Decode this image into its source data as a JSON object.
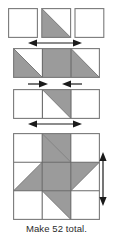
{
  "diagram": {
    "kind": "quilt-block-assembly-diagram",
    "caption": "Make 52 total.",
    "colors": {
      "fabric_shaded": "#9b9b9b",
      "fabric_background": "#ffffff",
      "outline": "#7a7a7a",
      "seam_line": "#6a6a6a",
      "arrow": "#1a1a1a",
      "caption_text": "#2b2b2b"
    },
    "rows": [
      {
        "id": "row-1",
        "name": "three-patch-top-row",
        "cells": [
          {
            "name": "plain-square-left",
            "fill": "background"
          },
          {
            "name": "half-square-triangle-gray-lower-left",
            "fill": "triangle-lower-left"
          },
          {
            "name": "plain-square-right",
            "fill": "background"
          }
        ]
      },
      {
        "id": "row-2",
        "name": "middle-row-strip",
        "cells": [
          {
            "name": "half-square-triangle-gray-lower-left",
            "fill": "triangle-lower-left"
          },
          {
            "name": "solid-gray-square",
            "fill": "shaded"
          },
          {
            "name": "half-square-triangle-gray-lower-left",
            "fill": "triangle-lower-left"
          }
        ]
      },
      {
        "id": "row-3",
        "name": "three-patch-bottom-row",
        "cells": [
          {
            "name": "plain-square-left",
            "fill": "background"
          },
          {
            "name": "half-square-triangle-gray-upper-right",
            "fill": "triangle-upper-right"
          },
          {
            "name": "plain-square-right",
            "fill": "background"
          }
        ]
      }
    ],
    "arrow_sets": [
      {
        "id": "arrows-row2-top",
        "name": "width-arrows-outward-top",
        "direction": "outward",
        "orientation": "horizontal"
      },
      {
        "id": "arrows-row2-bottom",
        "name": "width-arrows-inward-bottom",
        "direction": "inward",
        "orientation": "horizontal"
      },
      {
        "id": "arrows-row3-bottom",
        "name": "width-arrows-outward-lower",
        "direction": "outward",
        "orientation": "horizontal"
      },
      {
        "id": "arrows-star-right",
        "name": "height-arrows-outward-right",
        "direction": "outward",
        "orientation": "vertical"
      }
    ],
    "final_block": {
      "name": "pinwheel-star-block",
      "grid": "3x3",
      "description": "Assembled star block with shaded center square and four rotating star points"
    }
  }
}
